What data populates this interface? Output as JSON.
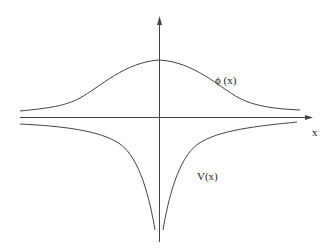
{
  "figure": {
    "labels": {
      "phi": "ϕ (x)",
      "x_axis": "x",
      "potential": "V(x)"
    },
    "colors": {
      "background": "#ffffff",
      "stroke": "#333333"
    }
  },
  "diagram": {
    "type": "function-sketch",
    "axes": {
      "horizontal": {
        "label": "x",
        "arrow": "right"
      },
      "vertical": {
        "label": "",
        "arrow": "up"
      }
    },
    "curves": [
      {
        "name": "phi(x)",
        "label": "ϕ (x)",
        "shape": "bell-shaped bump above axis, decaying to zero at both ends"
      },
      {
        "name": "V(x)",
        "label": "V(x)",
        "shape": "symmetric potential well below axis, sharply dipping near x=0, approaching zero at both ends"
      }
    ]
  }
}
